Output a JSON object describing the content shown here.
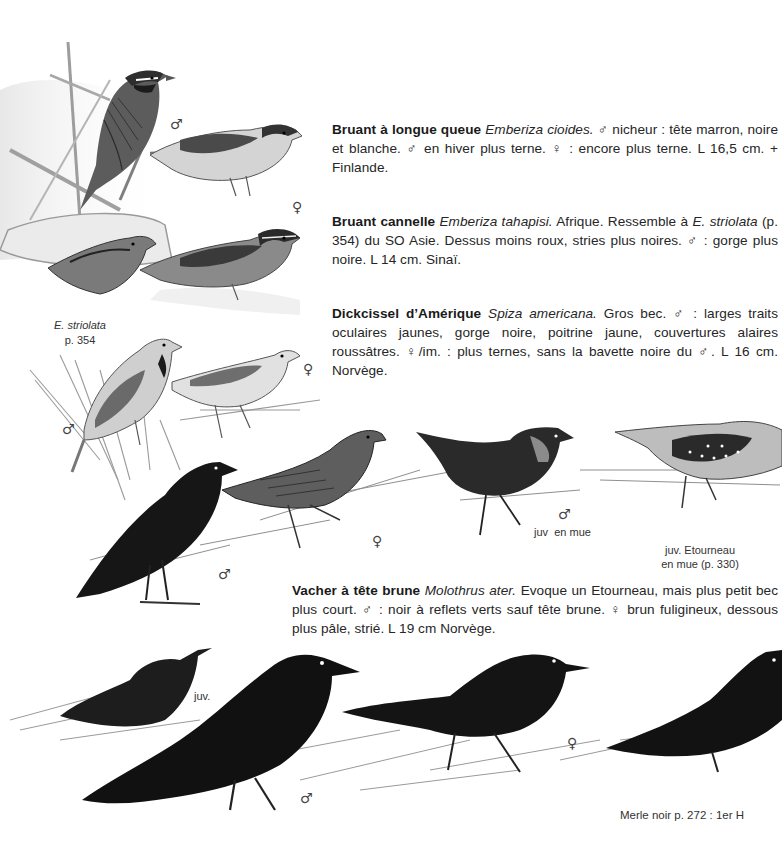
{
  "entries": [
    {
      "name": "Bruant à longue queue",
      "latin": "Emberiza cioides.",
      "text": " ♂ nicheur : tête marron, noire et blanche. ♂ en hiver plus terne. ♀ : encore plus terne. L 16,5 cm. + Finlande."
    },
    {
      "name": "Bruant cannelle",
      "latin": "Emberiza tahapisi.",
      "text_before_ref": " Afrique. Ressemble à ",
      "ref_latin": "E. striolata",
      "text": " (p. 354) du SO Asie. Dessus moins roux, stries plus noires. ♂ : gorge plus noire. L 14 cm. Sinaï."
    },
    {
      "name": "Dickcissel d’Amérique",
      "latin": "Spiza americana.",
      "text": " Gros bec. ♂ : larges traits oculaires jaunes, gorge noire, poitrine jaune, couvertures alaires roussâtres. ♀/im. : plus ternes, sans la bavette noire du ♂. L 16 cm. Norvège."
    },
    {
      "name": "Vacher à tête brune",
      "latin": "Molothrus ater.",
      "text": " Evoque un Etourneau, mais plus petit bec plus court. ♂ : noir à reflets verts sauf tête brune. ♀ brun fuligineux, dessous plus pâle, strié. L 19 cm Norvège."
    }
  ],
  "labels": {
    "striolata_name": "E. striolata",
    "striolata_page": "p. 354",
    "juv_en_mue": "juv  en mue",
    "etourneau_line1": "juv. Etourneau",
    "etourneau_line2": "en mue (p. 330)",
    "juv": "juv.",
    "merle": "Merle noir p. 272 : 1er H"
  },
  "sex_symbols": {
    "male": "♂",
    "female": "♀"
  },
  "colors": {
    "paper": "#ffffff",
    "text": "#262626",
    "ink_dark": "#141414",
    "ink_mid": "#555555",
    "ink_light": "#9a9a9a",
    "wash": "#e6e6e6"
  }
}
